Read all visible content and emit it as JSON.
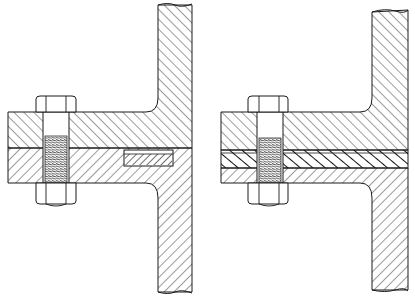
{
  "diagram": {
    "title": "",
    "figures": [
      {
        "id": "left",
        "description": "Bolted flange joint with gasket in recessed groove",
        "components": [
          "upper-flange",
          "lower-flange",
          "vertical-web",
          "hex-bolt",
          "hex-nut",
          "groove-gasket"
        ]
      },
      {
        "id": "right",
        "description": "Bolted flange joint with full-face gasket between flanges",
        "components": [
          "upper-flange",
          "lower-flange",
          "vertical-web",
          "hex-bolt",
          "hex-nut",
          "full-face-gasket"
        ]
      }
    ],
    "colors": {
      "line": "#1a1a1a",
      "background": "#ffffff",
      "thread": "#555555"
    }
  }
}
